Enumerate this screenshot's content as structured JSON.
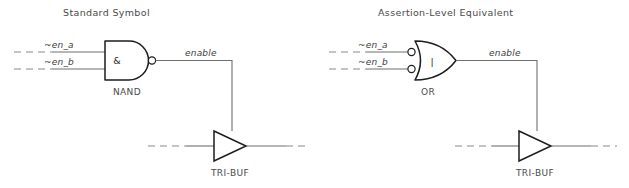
{
  "figure": {
    "background_color": "#ffffff",
    "line_color": "#6f6f6f",
    "gate_stroke_color": "#1d1d1d",
    "text_color": "#4a4a4a",
    "width": 629,
    "height": 188
  },
  "panels": [
    {
      "id": "standard",
      "title": "Standard Symbol",
      "gate": {
        "name": "NAND",
        "operator_symbol": "&",
        "shape": "and-d-shape",
        "output_bubble": true,
        "input_bubbles": false
      },
      "inputs": [
        {
          "label": "~en_a"
        },
        {
          "label": "~en_b"
        }
      ],
      "output": {
        "label": "enable"
      },
      "buffer": {
        "name": "TRI-BUF",
        "shape": "triangle"
      }
    },
    {
      "id": "assertion",
      "title": "Assertion-Level Equivalent",
      "gate": {
        "name": "OR",
        "operator_symbol": "|",
        "shape": "or-curved-shape",
        "output_bubble": false,
        "input_bubbles": true
      },
      "inputs": [
        {
          "label": "~en_a"
        },
        {
          "label": "~en_b"
        }
      ],
      "output": {
        "label": "enable"
      },
      "buffer": {
        "name": "TRI-BUF",
        "shape": "triangle"
      }
    }
  ]
}
